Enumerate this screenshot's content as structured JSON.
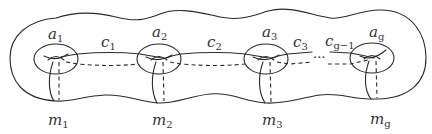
{
  "diagram": {
    "handles": [
      {
        "a_base": "a",
        "a_sub": "1",
        "m_base": "m",
        "m_sub": "1"
      },
      {
        "a_base": "a",
        "a_sub": "2",
        "m_base": "m",
        "m_sub": "2"
      },
      {
        "a_base": "a",
        "a_sub": "3",
        "m_base": "m",
        "m_sub": "3"
      },
      {
        "a_base": "a",
        "a_sub": "g",
        "m_base": "m",
        "m_sub": "g"
      }
    ],
    "connectors": [
      {
        "base": "c",
        "sub": "1"
      },
      {
        "base": "c",
        "sub": "2"
      },
      {
        "base": "c",
        "sub": "3"
      },
      {
        "base": "c",
        "sub": "g−1"
      }
    ],
    "ellipsis": "···",
    "colors": {
      "line": "#2a2a2a",
      "text": "#333333",
      "background": "#ffffff"
    }
  }
}
